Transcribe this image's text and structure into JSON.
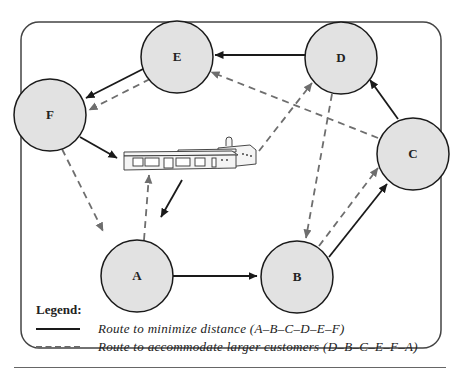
{
  "diagram": {
    "colors": {
      "node_fill": "#e2e2e2",
      "node_stroke": "#1a1a1a",
      "solid_route": "#1a1a1a",
      "dashed_route": "#6e6e6e",
      "frame": "#444444"
    },
    "nodes": [
      {
        "id": "E",
        "label": "E",
        "x": 177,
        "y": 57
      },
      {
        "id": "D",
        "label": "D",
        "x": 341,
        "y": 58
      },
      {
        "id": "F",
        "label": "F",
        "x": 50,
        "y": 115
      },
      {
        "id": "C",
        "label": "C",
        "x": 413,
        "y": 154
      },
      {
        "id": "A",
        "label": "A",
        "x": 137,
        "y": 276
      },
      {
        "id": "B",
        "label": "B",
        "x": 297,
        "y": 277
      }
    ],
    "depot": {
      "label": "warehouse",
      "x": 178,
      "y": 168
    },
    "routes": [
      {
        "name": "Route to minimize distance",
        "sequence": "A-B-C-D-E-F",
        "style": "solid"
      },
      {
        "name": "Route to accommodate larger customers",
        "sequence": "D-B-C-E-F-A",
        "style": "dashed"
      }
    ]
  },
  "legend": {
    "title": "Legend:",
    "items": [
      {
        "style": "solid",
        "label": "Route to minimize distance (A–B–C–D–E–F)"
      },
      {
        "style": "dashed",
        "label": "Route to accommodate larger customers (D–B–C–E–F–A)"
      }
    ]
  }
}
